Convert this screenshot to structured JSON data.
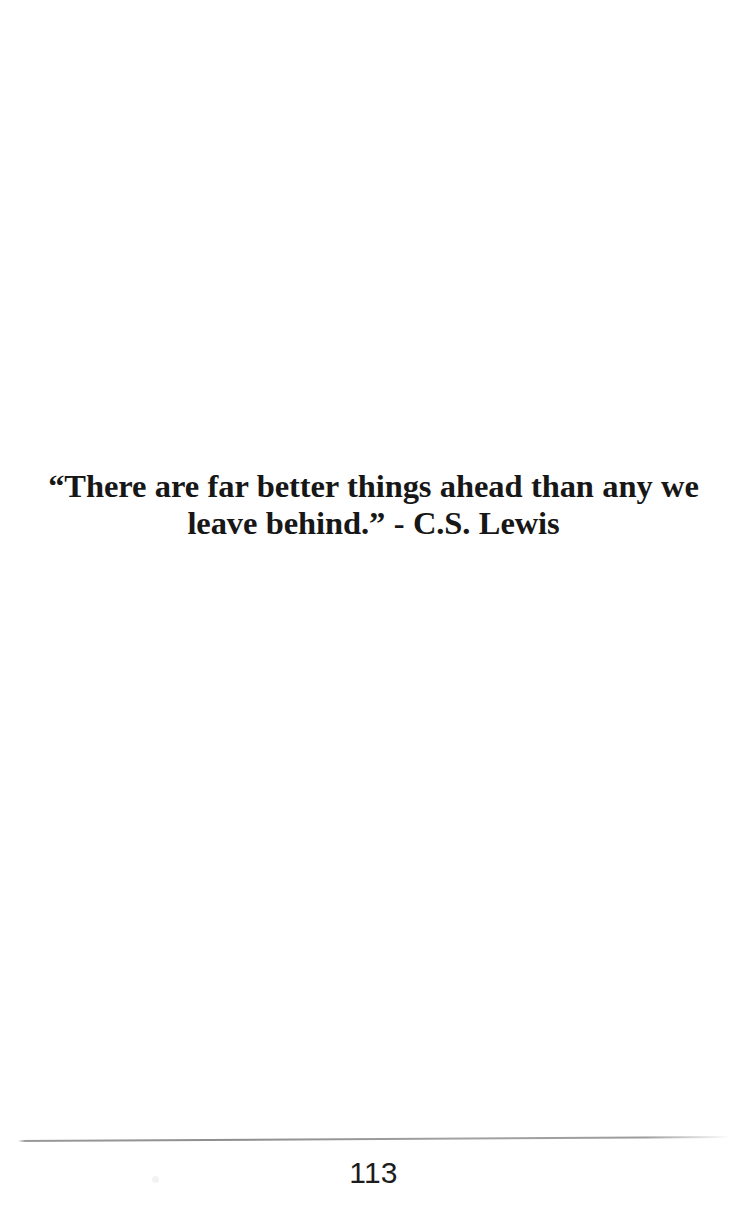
{
  "page": {
    "background_color": "#ffffff",
    "width": 747,
    "height": 1228
  },
  "quote": {
    "full_text": "“There are far better things ahead than any we leave behind.” - C.S. Lewis",
    "line_1": "“There are far better things ahead than any we",
    "line_2": "leave behind.” - C.S. Lewis",
    "attribution": "C.S. Lewis",
    "text_color": "#171717"
  },
  "footer": {
    "page_number": "113",
    "rule_color": "#9a9a9a",
    "page_number_color": "#1c1c1c"
  }
}
